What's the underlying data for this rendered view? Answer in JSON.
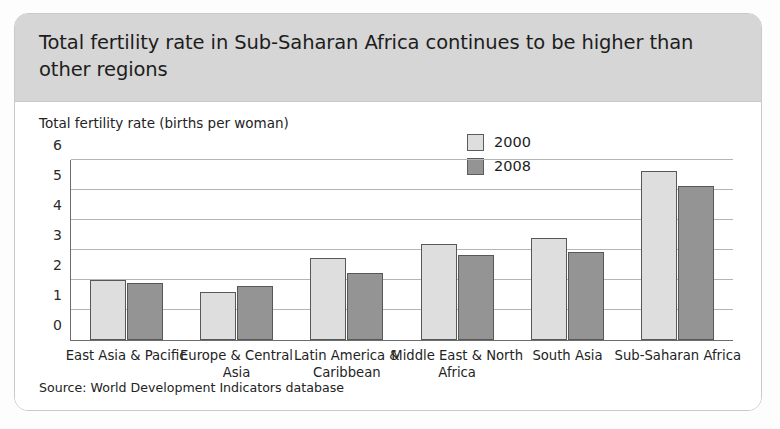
{
  "card": {
    "title": "Total fertility rate in Sub-Saharan Africa continues to be higher than other regions",
    "source": "Source: World Development Indicators database"
  },
  "colors": {
    "series_2000": "#dedede",
    "series_2008": "#949494",
    "bar_outline": "#585858",
    "title_band": "#d6d6d6",
    "gridline": "#b5b5b5",
    "axis": "#6d6d6d"
  },
  "chart_data": {
    "type": "bar",
    "title": "Total fertility rate in Sub-Saharan Africa continues to be higher than other regions",
    "subtitle": "",
    "xlabel": "",
    "ylabel": "Total fertility rate (births per woman)",
    "ylim": [
      0,
      6
    ],
    "yticks": [
      0,
      1,
      2,
      3,
      4,
      5,
      6
    ],
    "ytick_labels": [
      "0",
      "1",
      "2",
      "3",
      "4",
      "5",
      "6"
    ],
    "grid": true,
    "legend_position": "top-right",
    "categories": [
      "East Asia & Pacific",
      "Europe & Central Asia",
      "Latin America & Caribbean",
      "Middle East & North Africa",
      "South Asia",
      "Sub-Saharan Africa"
    ],
    "series": [
      {
        "name": "2000",
        "values": [
          2.0,
          1.6,
          2.75,
          3.2,
          3.4,
          5.65
        ]
      },
      {
        "name": "2008",
        "values": [
          1.9,
          1.8,
          2.25,
          2.85,
          2.95,
          5.15
        ]
      }
    ],
    "annotations": [],
    "source": "Source: World Development Indicators database"
  }
}
